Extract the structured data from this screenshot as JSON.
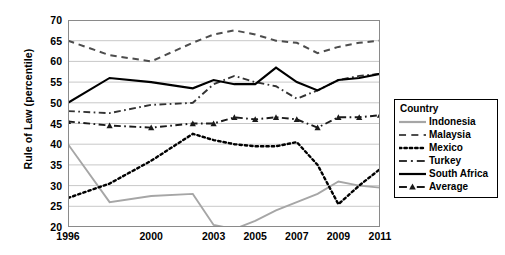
{
  "chart_data": {
    "type": "line",
    "title": "",
    "xlabel": "",
    "ylabel": "Rule of Law (percentile)",
    "ylim": [
      20,
      70
    ],
    "ytick_values": [
      20,
      25,
      30,
      35,
      40,
      45,
      50,
      55,
      60,
      65,
      70
    ],
    "ytick_labels": [
      "20",
      "25",
      "30",
      "35",
      "40",
      "45",
      "50",
      "55",
      "60",
      "65",
      "70"
    ],
    "grid": true,
    "grid_axis": "y",
    "legend_position": "right",
    "legend_title": "Country",
    "x": [
      1996,
      1998,
      2000,
      2002,
      2003,
      2004,
      2005,
      2006,
      2007,
      2008,
      2009,
      2010,
      2011
    ],
    "xtick_labels": [
      "1996",
      "2000",
      "2003",
      "2005",
      "2007",
      "2009",
      "2011"
    ],
    "xtick_x": [
      1996,
      2000,
      2003,
      2005,
      2007,
      2009,
      2011
    ],
    "series": [
      {
        "name": "Indonesia",
        "style": "solid",
        "color": "#a6a6a6",
        "marker": "none",
        "values": [
          40.0,
          26.0,
          27.5,
          28.0,
          20.5,
          19.5,
          21.5,
          24.0,
          26.0,
          28.0,
          31.0,
          30.0,
          29.5
        ]
      },
      {
        "name": "Malaysia",
        "style": "dashed",
        "color": "#4d4d4d",
        "marker": "none",
        "values": [
          65.0,
          61.5,
          60.0,
          64.5,
          66.5,
          67.5,
          66.5,
          65.0,
          64.5,
          62.0,
          63.5,
          64.5,
          65.0
        ]
      },
      {
        "name": "Mexico",
        "style": "dotted",
        "color": "#000000",
        "marker": "none",
        "values": [
          27.0,
          30.5,
          36.0,
          42.5,
          41.0,
          40.0,
          39.5,
          39.5,
          40.5,
          35.0,
          25.5,
          30.0,
          34.0
        ]
      },
      {
        "name": "Turkey",
        "style": "dashdot",
        "color": "#333333",
        "marker": "none",
        "values": [
          48.0,
          47.5,
          49.5,
          50.0,
          54.5,
          56.5,
          55.0,
          54.0,
          51.0,
          53.0,
          55.5,
          56.5,
          57.0
        ]
      },
      {
        "name": "South Africa",
        "style": "solid",
        "color": "#000000",
        "marker": "none",
        "values": [
          50.0,
          56.0,
          55.0,
          53.5,
          55.5,
          54.5,
          54.5,
          58.5,
          55.0,
          53.0,
          55.5,
          56.0,
          57.0
        ]
      },
      {
        "name": "Average",
        "style": "dashdot",
        "color": "#1a1a1a",
        "marker": "triangle",
        "values": [
          45.5,
          44.5,
          44.0,
          45.0,
          45.0,
          46.5,
          46.0,
          46.5,
          46.0,
          44.0,
          46.5,
          46.5,
          47.0
        ]
      }
    ]
  }
}
